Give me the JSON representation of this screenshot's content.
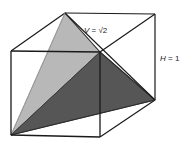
{
  "figure": {
    "labels": {
      "volume_label": "V = √2",
      "volume_var": "V",
      "volume_eq": " = ",
      "volume_value": "√2",
      "height_label": "H = 1",
      "height_var": "H",
      "height_eq": " = ",
      "height_value": "1"
    },
    "colors": {
      "background": "#ffffff",
      "edge": "#1a1a1a",
      "hidden_edge": "#555555",
      "face_light": "#b8b8b8",
      "face_dark": "#565656",
      "face_light_edge": "#8a8a8a",
      "text": "#1a1a1a"
    },
    "geometry": {
      "cube_vertices": {
        "front_top_left": [
          11,
          51
        ],
        "front_top_right": [
          100,
          52
        ],
        "front_bottom_left": [
          11,
          135
        ],
        "front_bottom_right": [
          100,
          137
        ],
        "back_top_left": [
          65,
          13
        ],
        "back_top_right": [
          155,
          14
        ],
        "back_bottom_left": [
          65,
          98
        ],
        "back_bottom_right": [
          155,
          100
        ]
      },
      "tetrahedron_vertices": {
        "apex_front_bottom_left": [
          11,
          135
        ],
        "back_top_left": [
          65,
          13
        ],
        "front_top_right": [
          100,
          52
        ],
        "back_bottom_right": [
          155,
          100
        ]
      },
      "faces": [
        {
          "name": "left-light-face",
          "shade": "light",
          "points": "11,135 65,13 100,52"
        },
        {
          "name": "right-dark-face",
          "shade": "dark",
          "points": "11,135 100,52 155,100"
        }
      ],
      "hidden_edges": [
        {
          "name": "back-vertical-edge",
          "from": [
            65,
            13
          ],
          "to": [
            65,
            98
          ]
        },
        {
          "name": "back-bottom-right-edge",
          "from": [
            65,
            98
          ],
          "to": [
            155,
            100
          ]
        },
        {
          "name": "back-bottom-left-edge",
          "from": [
            11,
            135
          ],
          "to": [
            65,
            98
          ]
        }
      ],
      "label_positions": {
        "volume": [
          84,
          33
        ],
        "height": [
          160,
          61
        ]
      }
    }
  }
}
